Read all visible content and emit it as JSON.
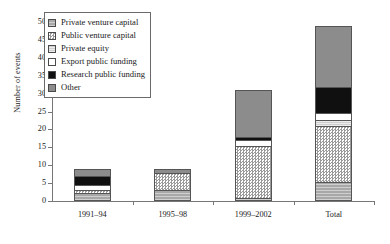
{
  "chart_data": {
    "type": "bar",
    "subtype": "stacked",
    "title": "",
    "xlabel": "",
    "ylabel": "Number of events",
    "ylim": [
      0,
      50
    ],
    "yticks": [
      0,
      5,
      10,
      15,
      20,
      25,
      30,
      35,
      40,
      45,
      50
    ],
    "ytick_labels": [
      "0",
      "5",
      "10",
      "15",
      "20",
      "25",
      "30",
      "35",
      "40",
      "45",
      "50"
    ],
    "grid": false,
    "legend_position": "upper-left-inside",
    "categories": [
      "1991–94",
      "1995–98",
      "1999–2002",
      "Total"
    ],
    "series": [
      {
        "name": "Private venture capital",
        "values": [
          2,
          3,
          0.5,
          5
        ],
        "fill": "private-venture-capital"
      },
      {
        "name": "Public venture capital",
        "values": [
          1,
          5,
          15,
          16
        ],
        "fill": "public-venture-capital"
      },
      {
        "name": "Private equity",
        "values": [
          0,
          0,
          0,
          1.5
        ],
        "fill": "private-equity"
      },
      {
        "name": "Export public funding",
        "values": [
          1.5,
          0,
          1.5,
          2
        ],
        "fill": "export-public-funding"
      },
      {
        "name": "Research public funding",
        "values": [
          2.5,
          0,
          1,
          7.5
        ],
        "fill": "research-public-funding"
      },
      {
        "name": "Other",
        "values": [
          2,
          1,
          13,
          17
        ],
        "fill": "other"
      }
    ],
    "totals": [
      9,
      9,
      31,
      49
    ]
  },
  "legend": {
    "items": [
      {
        "label": "Private venture capital",
        "swatch": "private-venture-capital-swatch"
      },
      {
        "label": "Public venture capital",
        "swatch": "public-venture-capital-swatch"
      },
      {
        "label": "Private equity",
        "swatch": "private-equity-swatch"
      },
      {
        "label": "Export public funding",
        "swatch": "export-public-funding-swatch"
      },
      {
        "label": "Research public funding",
        "swatch": "research-public-funding-swatch"
      },
      {
        "label": "Other",
        "swatch": "other-swatch"
      }
    ]
  },
  "colors": {
    "private_venture_capital": "#a8a8a8",
    "public_venture_capital": "#d8d8d8",
    "private_equity": "#cfcfcf",
    "export_public_funding": "#ffffff",
    "research_public_funding": "#101010",
    "other": "#8c8c8c",
    "axis": "#777777",
    "text": "#1a1a1a"
  }
}
